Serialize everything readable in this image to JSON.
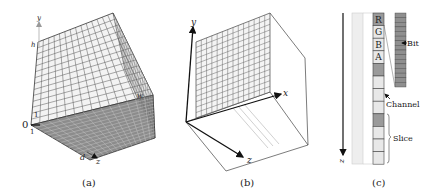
{
  "panels": [
    {
      "id": "a",
      "caption": "(a)",
      "axis_labels": {
        "y": "y",
        "x": "w",
        "z": "z",
        "h": "h",
        "d": "d",
        "origin": "0",
        "one_y": "1",
        "one_z": "1"
      },
      "grid": {
        "rows": 14,
        "cols": 14
      },
      "colors": {
        "top_face": "#f2f2f2",
        "bottom_face": "#8a8a8a",
        "grid_line": "#555555"
      }
    },
    {
      "id": "b",
      "caption": "(b)",
      "axis_labels": {
        "y": "y",
        "x": "x",
        "z": "z"
      },
      "grid": {
        "rows": 14,
        "cols": 14
      },
      "colors": {
        "face": "#f4f4f4",
        "grid_line": "#666666",
        "slice_line": "#bbbbbb"
      }
    },
    {
      "id": "c",
      "caption": "(c)",
      "axis_label": "z",
      "channels": [
        "R",
        "G",
        "B",
        "A"
      ],
      "labels": {
        "bit": "Bit",
        "channel": "Channel",
        "slice": "Slice"
      },
      "cell_colors": [
        "#9a9a9a",
        "#e8e8e8",
        "#e8e8e8",
        "#e8e8e8",
        "#9a9a9a",
        "#e8e8e8",
        "#e8e8e8",
        "#e8e8e8",
        "#9a9a9a",
        "#e8e8e8",
        "#e8e8e8",
        "#e8e8e8"
      ],
      "bit_count": 16,
      "colors": {
        "strip": "#eeeeee",
        "bit": "#8f8f8f"
      }
    }
  ]
}
